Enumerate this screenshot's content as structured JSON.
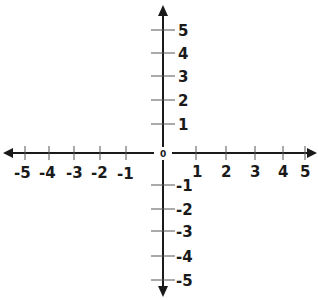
{
  "diagram": {
    "type": "coordinate-plane",
    "origin_label": "0",
    "x_axis": {
      "negative_labels": [
        "-5",
        "-4",
        "-3",
        "-2",
        "-1"
      ],
      "positive_labels": [
        "1",
        "2",
        "3",
        "4",
        "5"
      ],
      "range": [
        -5,
        5
      ],
      "arrows": "both"
    },
    "y_axis": {
      "positive_labels": [
        "5",
        "4",
        "3",
        "2",
        "1"
      ],
      "negative_labels": [
        "-1",
        "-2",
        "-3",
        "-4",
        "-5"
      ],
      "range": [
        -5,
        5
      ],
      "arrows": "both"
    },
    "colors": {
      "axis": "#1a1a1a",
      "background": "#ffffff"
    }
  }
}
